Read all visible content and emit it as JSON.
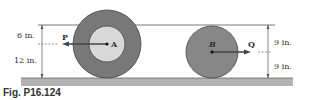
{
  "figure": {
    "caption": "Fig. P16.124",
    "colors": {
      "outer_disk": "#7a7a7a",
      "inner_hub": "#d6d6d6",
      "disk_b": "#8a8a8a",
      "ground": "#b0b0b0",
      "line": "#555555"
    },
    "disk_a": {
      "label": "A",
      "force_label": "P",
      "dims": [
        {
          "label": "6 in."
        },
        {
          "label": "12 in."
        }
      ]
    },
    "disk_b": {
      "label": "B",
      "force_label": "Q",
      "dims": [
        {
          "label": "9 in."
        },
        {
          "label": "9 in."
        }
      ]
    }
  }
}
